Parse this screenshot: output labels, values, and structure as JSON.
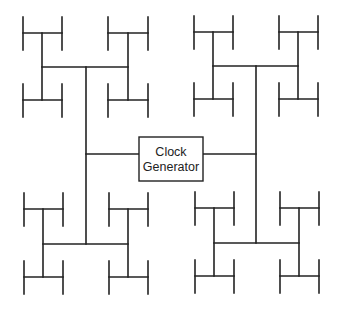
{
  "diagram": {
    "source_block": {
      "label_line1": "Clock",
      "label_line2": "Generator"
    },
    "quadrants": [
      "top-left",
      "top-right",
      "bottom-left",
      "bottom-right"
    ],
    "levels": 3,
    "leaf_count": 32,
    "colors": {
      "line": "#222222",
      "background": "#ffffff"
    }
  }
}
